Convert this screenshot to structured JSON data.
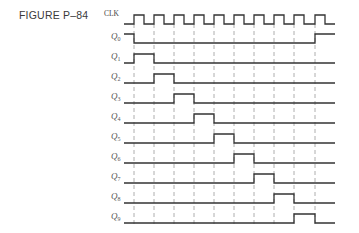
{
  "figure": {
    "title": "FIGURE P–84"
  },
  "diagram": {
    "x_start": 124,
    "x_end": 335,
    "pulse_height": 9,
    "guide_top": 24,
    "guide_bottom": 226,
    "clock_rising_edges": [
      134,
      154,
      174,
      194,
      214,
      234,
      254,
      274,
      294,
      315
    ],
    "clock_half_period": 10,
    "colors": {
      "waveform": "#333333",
      "guide": "#9a9a9a",
      "label": "#555555"
    },
    "signals": [
      {
        "name": "CLK",
        "sub": "",
        "baseline": 24,
        "type": "clock"
      },
      {
        "name": "Q",
        "sub": "0",
        "baseline": 43,
        "type": "levels",
        "segments": [
          {
            "from": 124,
            "to": 134,
            "level": 1
          },
          {
            "from": 134,
            "to": 315,
            "level": 0
          },
          {
            "from": 315,
            "to": 335,
            "level": 1
          }
        ]
      },
      {
        "name": "Q",
        "sub": "1",
        "baseline": 63,
        "type": "levels",
        "segments": [
          {
            "from": 124,
            "to": 134,
            "level": 0
          },
          {
            "from": 134,
            "to": 154,
            "level": 1
          },
          {
            "from": 154,
            "to": 335,
            "level": 0
          }
        ]
      },
      {
        "name": "Q",
        "sub": "2",
        "baseline": 83,
        "type": "levels",
        "segments": [
          {
            "from": 124,
            "to": 154,
            "level": 0
          },
          {
            "from": 154,
            "to": 174,
            "level": 1
          },
          {
            "from": 174,
            "to": 335,
            "level": 0
          }
        ]
      },
      {
        "name": "Q",
        "sub": "3",
        "baseline": 103,
        "type": "levels",
        "segments": [
          {
            "from": 124,
            "to": 174,
            "level": 0
          },
          {
            "from": 174,
            "to": 194,
            "level": 1
          },
          {
            "from": 194,
            "to": 335,
            "level": 0
          }
        ]
      },
      {
        "name": "Q",
        "sub": "4",
        "baseline": 123,
        "type": "levels",
        "segments": [
          {
            "from": 124,
            "to": 194,
            "level": 0
          },
          {
            "from": 194,
            "to": 214,
            "level": 1
          },
          {
            "from": 214,
            "to": 335,
            "level": 0
          }
        ]
      },
      {
        "name": "Q",
        "sub": "5",
        "baseline": 143,
        "type": "levels",
        "segments": [
          {
            "from": 124,
            "to": 214,
            "level": 0
          },
          {
            "from": 214,
            "to": 234,
            "level": 1
          },
          {
            "from": 234,
            "to": 335,
            "level": 0
          }
        ]
      },
      {
        "name": "Q",
        "sub": "6",
        "baseline": 163,
        "type": "levels",
        "segments": [
          {
            "from": 124,
            "to": 234,
            "level": 0
          },
          {
            "from": 234,
            "to": 254,
            "level": 1
          },
          {
            "from": 254,
            "to": 335,
            "level": 0
          }
        ]
      },
      {
        "name": "Q",
        "sub": "7",
        "baseline": 183,
        "type": "levels",
        "segments": [
          {
            "from": 124,
            "to": 254,
            "level": 0
          },
          {
            "from": 254,
            "to": 274,
            "level": 1
          },
          {
            "from": 274,
            "to": 335,
            "level": 0
          }
        ]
      },
      {
        "name": "Q",
        "sub": "8",
        "baseline": 203,
        "type": "levels",
        "segments": [
          {
            "from": 124,
            "to": 274,
            "level": 0
          },
          {
            "from": 274,
            "to": 294,
            "level": 1
          },
          {
            "from": 294,
            "to": 335,
            "level": 0
          }
        ]
      },
      {
        "name": "Q",
        "sub": "9",
        "baseline": 223,
        "type": "levels",
        "segments": [
          {
            "from": 124,
            "to": 294,
            "level": 0
          },
          {
            "from": 294,
            "to": 315,
            "level": 1
          },
          {
            "from": 315,
            "to": 335,
            "level": 0
          }
        ]
      }
    ]
  }
}
